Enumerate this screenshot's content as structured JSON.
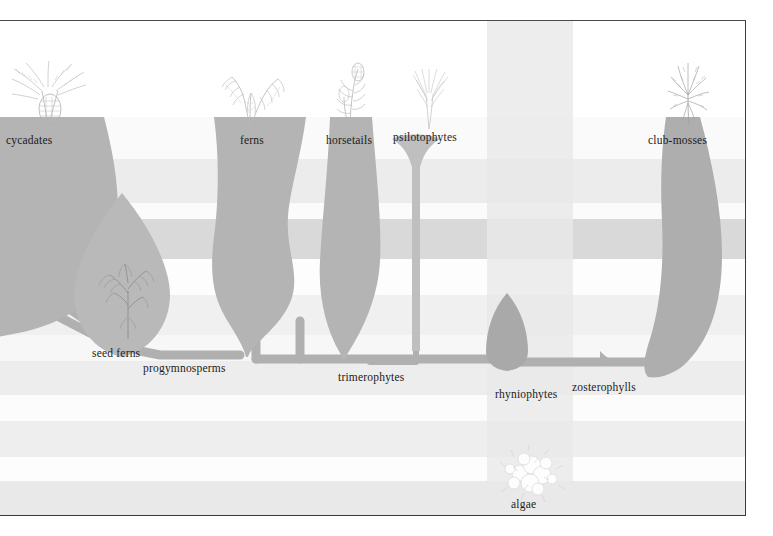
{
  "figure": {
    "type": "spindle-diagram",
    "domain": "plant-evolution-phylogeny",
    "frame": {
      "x": 0,
      "y": 21,
      "width": 745,
      "height": 494
    },
    "background_color": "#ffffff",
    "spindle_color": "#b4b4b4",
    "spindle_color_dark": "#a8a8a8",
    "text_color": "#1b1b1b",
    "border_color": "#3a3a3a"
  },
  "top_labels": [
    {
      "key": "cycadates",
      "text": "cycadates",
      "x": 6,
      "y": 118
    },
    {
      "key": "ferns",
      "text": "ferns",
      "x": 240,
      "y": 118
    },
    {
      "key": "horsetails",
      "text": "horsetails",
      "x": 326,
      "y": 118
    },
    {
      "key": "psilotophytes",
      "text": "psilotophytes",
      "x": 393,
      "y": 114
    },
    {
      "key": "club-mosses",
      "text": "club-mosses",
      "x": 648,
      "y": 118
    }
  ],
  "inner_labels": [
    {
      "key": "seed-ferns",
      "text": "seed ferns",
      "x": 92,
      "y": 333
    },
    {
      "key": "progymnosperms",
      "text": "progymnosperms",
      "x": 143,
      "y": 348
    },
    {
      "key": "trimerophytes",
      "text": "trimerophytes",
      "x": 338,
      "y": 357
    },
    {
      "key": "rhyniophytes",
      "text": "rhyniophytes",
      "x": 497,
      "y": 374
    },
    {
      "key": "zosterophylls",
      "text": "zosterophylls",
      "x": 573,
      "y": 367
    },
    {
      "key": "algae",
      "text": "algae",
      "x": 511,
      "y": 484
    }
  ],
  "bands": [
    {
      "name": "band-1-top-white",
      "top": 0,
      "height": 96,
      "color": "#ffffff"
    },
    {
      "name": "band-2-pale",
      "top": 96,
      "height": 42,
      "color": "#fafafa"
    },
    {
      "name": "band-3-light-grey",
      "top": 138,
      "height": 44,
      "color": "#ececec"
    },
    {
      "name": "band-4-white",
      "top": 182,
      "height": 16,
      "color": "#fbfbfb"
    },
    {
      "name": "band-5-dark-grey",
      "top": 198,
      "height": 40,
      "color": "#d9d9d9"
    },
    {
      "name": "band-6-white",
      "top": 238,
      "height": 36,
      "color": "#fdfdfd"
    },
    {
      "name": "band-7-pale-grey",
      "top": 274,
      "height": 40,
      "color": "#f0f0f0"
    },
    {
      "name": "band-8-light",
      "top": 314,
      "height": 26,
      "color": "#f7f7f7"
    },
    {
      "name": "band-9-grey",
      "top": 340,
      "height": 34,
      "color": "#ededed"
    },
    {
      "name": "band-10-white",
      "top": 374,
      "height": 26,
      "color": "#fcfcfc"
    },
    {
      "name": "band-11-grey",
      "top": 400,
      "height": 36,
      "color": "#eeeeee"
    },
    {
      "name": "band-12-white",
      "top": 436,
      "height": 24,
      "color": "#fdfdfd"
    },
    {
      "name": "band-13-grey",
      "top": 460,
      "height": 34,
      "color": "#e9e9e9"
    }
  ],
  "columns": [
    {
      "name": "ocean-column",
      "left": 487,
      "width": 86,
      "color": "#eaeaea",
      "opacity": 0.85
    }
  ],
  "sketches": [
    {
      "key": "cycad-sketch",
      "label": "cycad-plant-sketch",
      "x": 8,
      "y": 36,
      "w": 78,
      "h": 74
    },
    {
      "key": "fern-sketch",
      "label": "fern-plant-sketch",
      "x": 214,
      "y": 46,
      "w": 70,
      "h": 62
    },
    {
      "key": "horsetail-sketch",
      "label": "horsetail-plant-sketch",
      "x": 330,
      "y": 42,
      "w": 42,
      "h": 68
    },
    {
      "key": "psilotophyte-sketch",
      "label": "psilotophyte-plant-sketch",
      "x": 404,
      "y": 46,
      "w": 48,
      "h": 62
    },
    {
      "key": "clubmoss-sketch",
      "label": "club-moss-plant-sketch",
      "x": 662,
      "y": 36,
      "w": 52,
      "h": 68
    },
    {
      "key": "seedfern-sketch",
      "label": "seed-fern-plant-sketch",
      "x": 92,
      "y": 236,
      "w": 66,
      "h": 82
    },
    {
      "key": "algae-sketch",
      "label": "algae-sketch",
      "x": 496,
      "y": 424,
      "w": 72,
      "h": 58
    }
  ],
  "lineages": [
    {
      "key": "cycadates",
      "label": "cycadates",
      "first_appearance_band": 7,
      "extent": "extant"
    },
    {
      "key": "seed-ferns",
      "label": "seed ferns",
      "first_appearance_band": 9,
      "extent": "extinct"
    },
    {
      "key": "progymnosperms",
      "label": "progymnosperms",
      "first_appearance_band": 9,
      "extent": "extinct"
    },
    {
      "key": "ferns",
      "label": "ferns",
      "first_appearance_band": 9,
      "extent": "extant"
    },
    {
      "key": "horsetails",
      "label": "horsetails",
      "first_appearance_band": 9,
      "extent": "extant"
    },
    {
      "key": "trimerophytes",
      "label": "trimerophytes",
      "first_appearance_band": 10,
      "extent": "extinct"
    },
    {
      "key": "psilotophytes",
      "label": "psilotophytes",
      "first_appearance_band": 10,
      "extent": "extant"
    },
    {
      "key": "rhyniophytes",
      "label": "rhyniophytes",
      "first_appearance_band": 11,
      "extent": "extinct"
    },
    {
      "key": "zosterophylls",
      "label": "zosterophylls",
      "first_appearance_band": 11,
      "extent": "extinct"
    },
    {
      "key": "club-mosses",
      "label": "club-mosses",
      "first_appearance_band": 11,
      "extent": "extant"
    },
    {
      "key": "algae",
      "label": "algae",
      "first_appearance_band": 13,
      "extent": "extant"
    }
  ]
}
